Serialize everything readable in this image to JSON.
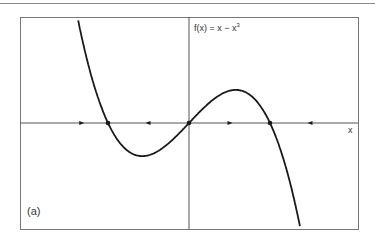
{
  "chart_data": {
    "type": "line",
    "title_parts": {
      "base": "f(x) = x − x",
      "exponent": "3"
    },
    "xlabel": "x",
    "ylabel": "",
    "panel_label": "(a)",
    "function": "x - x^3",
    "xlim": [
      -2.1,
      2.08
    ],
    "ylim": [
      -1.3,
      1.24
    ],
    "grid": false,
    "legend": null,
    "fixed_points": [
      {
        "x": -1,
        "y": 0,
        "stability": "stable"
      },
      {
        "x": 0,
        "y": 0,
        "stability": "unstable"
      },
      {
        "x": 1,
        "y": 0,
        "stability": "stable"
      }
    ],
    "flow_arrows": [
      {
        "x": -1.33,
        "direction": "right"
      },
      {
        "x": -0.5,
        "direction": "left"
      },
      {
        "x": 0.5,
        "direction": "right"
      },
      {
        "x": 1.5,
        "direction": "left"
      }
    ],
    "critical_points": [
      {
        "x": -0.577,
        "y": -0.385,
        "type": "local-min"
      },
      {
        "x": 0.577,
        "y": 0.385,
        "type": "local-max"
      }
    ],
    "colors": {
      "curve": "#1a1a1a",
      "axes": "#555555",
      "frame": "#777777"
    }
  }
}
